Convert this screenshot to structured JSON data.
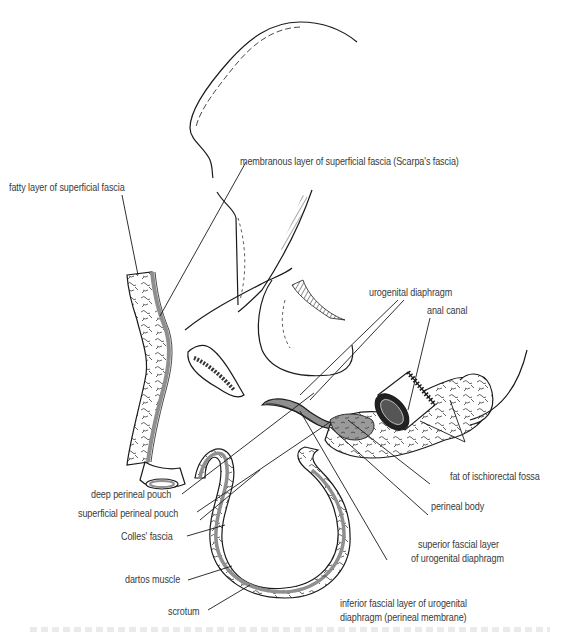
{
  "figure": {
    "colors": {
      "ink": "#1a1a1a",
      "label_text": "#3a3a3a",
      "fascia_fill": "#8f8f8f",
      "fat_fill": "#ffffff",
      "background": "#ffffff"
    }
  },
  "labels": {
    "fatty_layer": "fatty layer of superficial fascia",
    "membranous_layer": "membranous layer of superficial fascia (Scarpa's fascia)",
    "urogenital_diaphragm": "urogenital diaphragm",
    "anal_canal": "anal canal",
    "fat_ischiorectal": "fat of ischiorectal fossa",
    "perineal_body": "perineal body",
    "superior_fascial_1": "superior fascial layer",
    "superior_fascial_2": "of urogenital diaphragm",
    "inferior_fascial_1": "inferior fascial layer of urogenital",
    "inferior_fascial_2": "diaphragm (perineal membrane)",
    "deep_pouch": "deep perineal pouch",
    "superficial_pouch": "superficial perineal pouch",
    "colles": "Colles' fascia",
    "dartos": "dartos muscle",
    "scrotum": "scrotum"
  },
  "caption": {
    "visible": "cut off (illegible)"
  }
}
